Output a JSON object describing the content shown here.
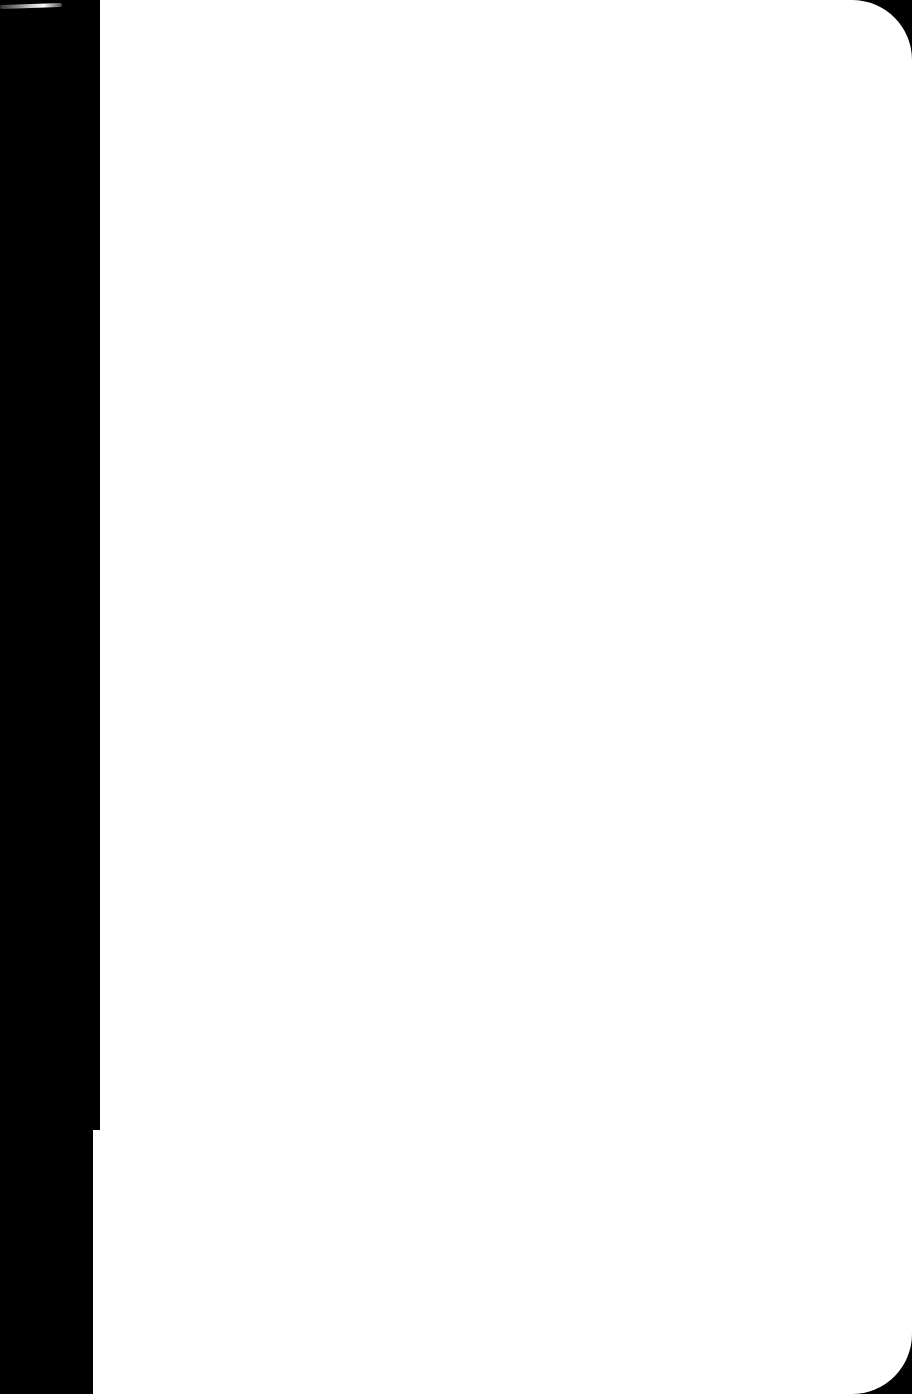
{
  "page": {
    "background_color": "#ffffff",
    "backdrop_color": "#000000",
    "content": ""
  }
}
